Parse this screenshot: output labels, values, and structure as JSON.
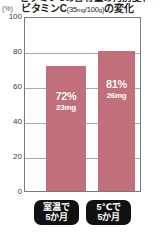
{
  "chart_data": {
    "type": "bar",
    "title": "ビタミンC(35mg/100g)の変化",
    "title_main_prefix": "ビタミンC",
    "title_paren_open": "(",
    "title_paren_num1": "35",
    "title_paren_unit1": "mg",
    "title_paren_slash": "/",
    "title_paren_num2": "100",
    "title_paren_unit2": "g",
    "title_paren_close": ")",
    "title_main_suffix": "の変化",
    "clipped_headline": "ビタミンCの含有量の月別変化",
    "ylabel": "(%)",
    "xlabel": "",
    "ylim": [
      0,
      100
    ],
    "yticks": [
      "100",
      "80",
      "60",
      "40",
      "20",
      "0"
    ],
    "gridlines": [
      80,
      60,
      40,
      20
    ],
    "grid": true,
    "legend": "none",
    "categories": [
      "室温で5か月",
      "5℃で5か月"
    ],
    "category_labels": [
      {
        "line1": "室温で",
        "line2": "5か月"
      },
      {
        "line1": "5℃で",
        "line2": "5か月"
      }
    ],
    "values": [
      72,
      81
    ],
    "data_labels": [
      {
        "percent": "72%",
        "amount": "23mg"
      },
      {
        "percent": "81%",
        "amount": "26mg"
      }
    ],
    "bar_color": "#c1707b",
    "frame_color": "#7a7a7a",
    "grid_color": "#a9a9a9",
    "pill_color": "#111111",
    "label_text_color": "#ffffff"
  }
}
